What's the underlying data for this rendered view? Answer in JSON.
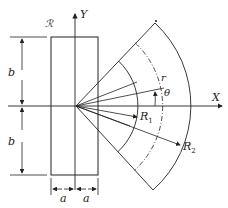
{
  "figure": {
    "region_label": "ℛ",
    "axes": {
      "x_label": "X",
      "y_label": "Y"
    },
    "dimensions": {
      "half_height_top": "b",
      "half_height_bottom": "b",
      "half_width_left": "a",
      "half_width_right": "a"
    },
    "polar": {
      "radius_label": "r",
      "angle_label": "θ",
      "inner_radius_label": "R",
      "inner_radius_sub": "1",
      "outer_radius_label": "R",
      "outer_radius_sub": "2"
    },
    "colors": {
      "stroke": "#222222",
      "background": "#ffffff"
    }
  }
}
